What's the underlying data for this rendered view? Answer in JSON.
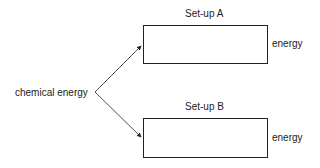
{
  "diagram": {
    "source_label": "chemical energy",
    "setups": [
      {
        "title": "Set-up A",
        "output_label": "energy"
      },
      {
        "title": "Set-up B",
        "output_label": "energy"
      }
    ],
    "colors": {
      "line": "#222222",
      "background": "#ffffff"
    }
  }
}
